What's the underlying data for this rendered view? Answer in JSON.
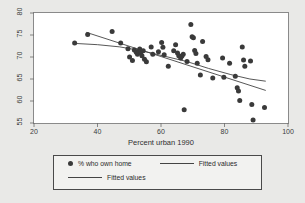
{
  "chart_data": {
    "type": "scatter",
    "title": "",
    "xlabel": "Percent urban 1990",
    "ylabel": "",
    "xlim": [
      20,
      100
    ],
    "ylim": [
      55,
      80
    ],
    "xticks": [
      20,
      40,
      60,
      80,
      100
    ],
    "yticks": [
      55,
      60,
      65,
      70,
      75,
      80
    ],
    "grid": false,
    "legend_position": "bottom",
    "legend": [
      {
        "label": "% who own home",
        "marker": "filled-circle",
        "color": "#3a3a3a"
      },
      {
        "label": "Fitted values",
        "marker": "line",
        "color": "#444444"
      },
      {
        "label": "Fitted values",
        "marker": "line",
        "color": "#444444"
      }
    ],
    "series": [
      {
        "name": "% who own home",
        "marker": "filled-circle",
        "color": "#3a3a3a",
        "points": [
          [
            32.8,
            73.2
          ],
          [
            36.9,
            75.1
          ],
          [
            44.6,
            75.8
          ],
          [
            47.3,
            73.2
          ],
          [
            49.6,
            71.9
          ],
          [
            50.1,
            70.0
          ],
          [
            51.0,
            69.2
          ],
          [
            51.6,
            71.6
          ],
          [
            52.2,
            71.1
          ],
          [
            52.6,
            70.6
          ],
          [
            53.0,
            71.3
          ],
          [
            53.3,
            71.8
          ],
          [
            53.6,
            71.0
          ],
          [
            54.0,
            70.3
          ],
          [
            54.4,
            71.4
          ],
          [
            54.8,
            69.5
          ],
          [
            55.4,
            68.9
          ],
          [
            56.9,
            72.3
          ],
          [
            57.4,
            70.6
          ],
          [
            59.2,
            71.2
          ],
          [
            60.2,
            73.3
          ],
          [
            60.6,
            72.2
          ],
          [
            61.0,
            70.5
          ],
          [
            62.3,
            67.9
          ],
          [
            64.0,
            71.4
          ],
          [
            64.6,
            72.8
          ],
          [
            65.2,
            70.9
          ],
          [
            65.6,
            70.3
          ],
          [
            66.2,
            69.8
          ],
          [
            66.6,
            70.2
          ],
          [
            67.0,
            70.6
          ],
          [
            67.3,
            58.0
          ],
          [
            68.2,
            69.0
          ],
          [
            69.4,
            77.4
          ],
          [
            69.8,
            74.6
          ],
          [
            70.2,
            74.4
          ],
          [
            70.6,
            71.5
          ],
          [
            71.0,
            70.8
          ],
          [
            71.4,
            68.6
          ],
          [
            72.4,
            65.9
          ],
          [
            73.1,
            73.5
          ],
          [
            74.2,
            70.1
          ],
          [
            74.8,
            69.4
          ],
          [
            76.3,
            65.2
          ],
          [
            79.4,
            69.8
          ],
          [
            79.8,
            65.4
          ],
          [
            81.6,
            68.6
          ],
          [
            83.4,
            65.6
          ],
          [
            84.0,
            63.0
          ],
          [
            84.4,
            62.3
          ],
          [
            84.8,
            60.1
          ],
          [
            85.6,
            72.3
          ],
          [
            86.0,
            69.3
          ],
          [
            86.4,
            67.9
          ],
          [
            88.2,
            69.1
          ],
          [
            88.6,
            59.2
          ],
          [
            89.0,
            55.7
          ],
          [
            92.6,
            58.5
          ]
        ]
      },
      {
        "name": "Fitted values",
        "type": "linear-fit",
        "color": "#444444",
        "endpoints": [
          [
            36.5,
            75.6
          ],
          [
            93.0,
            62.4
          ]
        ]
      },
      {
        "name": "Fitted values",
        "type": "lowess-fit",
        "color": "#444444",
        "path": [
          [
            32.6,
            73.1
          ],
          [
            40.0,
            72.8
          ],
          [
            47.0,
            72.3
          ],
          [
            54.0,
            71.4
          ],
          [
            61.0,
            70.2
          ],
          [
            68.0,
            69.0
          ],
          [
            75.0,
            67.4
          ],
          [
            82.0,
            66.0
          ],
          [
            88.0,
            65.0
          ],
          [
            93.0,
            64.5
          ]
        ]
      }
    ]
  }
}
